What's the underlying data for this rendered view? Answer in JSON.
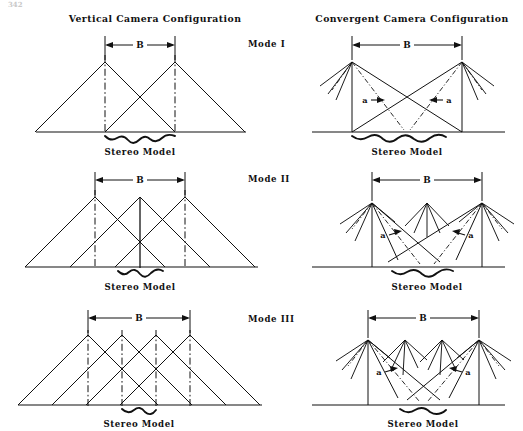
{
  "page": {
    "page_number": "342",
    "background_color": "#ffffff",
    "ink_color": "#111111"
  },
  "headers": {
    "left": "Vertical Camera Configuration",
    "right": "Convergent Camera Configuration"
  },
  "mode_labels": [
    "Mode I",
    "Mode II",
    "Mode III"
  ],
  "labels": {
    "baseline_dimension": "B",
    "stereo_model": "Stereo Model",
    "convergence_angle": "a"
  },
  "rows": [
    {
      "mode": "Mode I",
      "vertical": {
        "camera_count": 2,
        "baseline_spans": 1,
        "apex_xs": [
          105,
          175
        ],
        "apex_y": 62,
        "baseline_y": 132,
        "half_width": 70,
        "dimension_label": "B",
        "caption": "Stereo Model",
        "overlap_x": [
          105,
          175
        ],
        "centerline_style": "dash-dot"
      },
      "convergent": {
        "camera_count": 2,
        "baseline_spans": 1,
        "apex_xs": [
          352,
          462
        ],
        "apex_y": 62,
        "baseline_y": 132,
        "dimension_label": "B",
        "caption": "Stereo Model",
        "angle_label": "a",
        "has_fan_rays": true,
        "middle_fan_xs": []
      }
    },
    {
      "mode": "Mode II",
      "vertical": {
        "camera_count": 3,
        "baseline_spans": 2,
        "apex_xs": [
          95,
          140,
          185
        ],
        "apex_y": 197,
        "baseline_y": 267,
        "half_width": 70,
        "dimension_label": "B",
        "caption": "Stereo Model",
        "overlap_x": [
          118,
          163
        ],
        "centerline_style": "dash-dot"
      },
      "convergent": {
        "camera_count": 3,
        "baseline_spans": 2,
        "apex_xs": [
          372,
          427,
          482
        ],
        "apex_y": 203,
        "baseline_y": 267,
        "dimension_label": "B",
        "caption": "Stereo Model",
        "angle_label": "a",
        "has_fan_rays": true,
        "middle_fan_xs": [
          427
        ]
      }
    },
    {
      "mode": "Mode III",
      "vertical": {
        "camera_count": 4,
        "baseline_spans": 3,
        "apex_xs": [
          88,
          122,
          156,
          190
        ],
        "apex_y": 335,
        "baseline_y": 405,
        "half_width": 70,
        "dimension_label": "B",
        "caption": "Stereo Model",
        "overlap_x": [
          130,
          164
        ],
        "centerline_style": "dash-dot"
      },
      "convergent": {
        "camera_count": 4,
        "baseline_spans": 3,
        "apex_xs": [
          368,
          405,
          442,
          479
        ],
        "apex_y": 340,
        "baseline_y": 405,
        "dimension_label": "B",
        "caption": "Stereo Model",
        "angle_label": "a",
        "has_fan_rays": true,
        "middle_fan_xs": [
          405,
          442
        ]
      }
    }
  ]
}
